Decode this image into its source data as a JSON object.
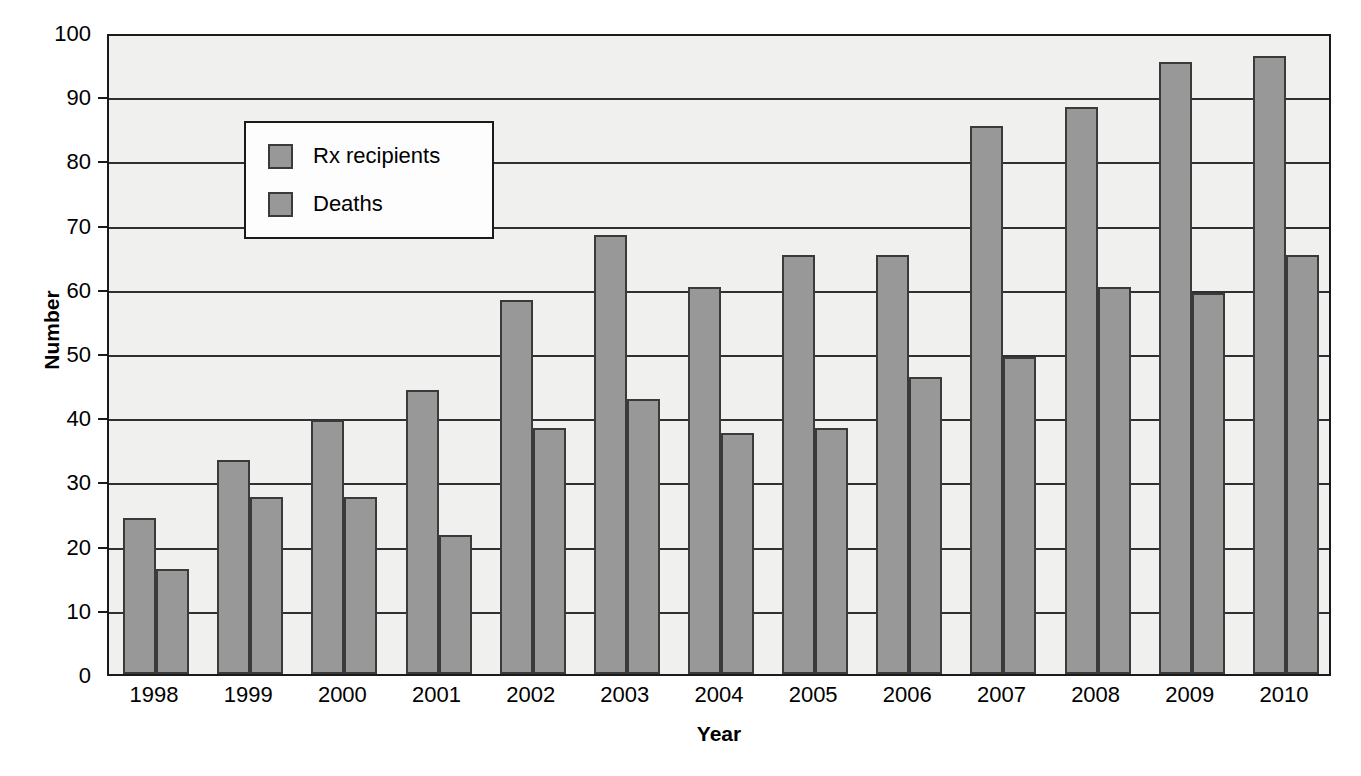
{
  "chart_data": {
    "type": "bar",
    "title": "",
    "xlabel": "Year",
    "ylabel": "Number",
    "categories": [
      "1998",
      "1999",
      "2000",
      "2001",
      "2002",
      "2003",
      "2004",
      "2005",
      "2006",
      "2007",
      "2008",
      "2009",
      "2010"
    ],
    "series": [
      {
        "name": "Rx recipients",
        "color": "#989898",
        "values": [
          24,
          33,
          39.3,
          44,
          58,
          68,
          60,
          65,
          65,
          85,
          88,
          95,
          96
        ]
      },
      {
        "name": "Deaths",
        "color": "#989898",
        "values": [
          16,
          27.2,
          27.2,
          21.4,
          38,
          42.6,
          37.2,
          38,
          46,
          49,
          60,
          59,
          65
        ]
      }
    ],
    "ylim": [
      0,
      100
    ],
    "yticks": [
      0,
      10,
      20,
      30,
      40,
      50,
      60,
      70,
      80,
      90,
      100
    ],
    "ytick_labels": [
      "0",
      "10",
      "20",
      "30",
      "40",
      "50",
      "60",
      "70",
      "80",
      "90",
      "100"
    ],
    "grid": true,
    "grid_axis": "y",
    "legend_position": "upper-left-inside",
    "legend_entries": [
      "Rx recipients",
      "Deaths"
    ],
    "plot_background": "#f0f0ef",
    "axis_color": "#1a1a1a",
    "bar_edge_color": "#3a3a3a"
  },
  "legend": {
    "entry_0_label": "Rx recipients",
    "entry_1_label": "Deaths"
  },
  "axes": {
    "x_title": "Year",
    "y_title": "Number"
  }
}
